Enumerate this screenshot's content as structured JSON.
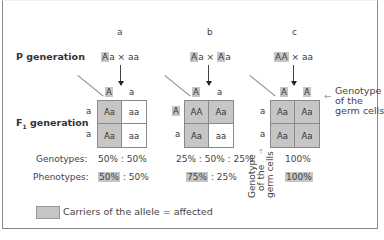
{
  "rows": {
    "p_generation": "P generation",
    "f1_generation_prefix": "F",
    "f1_generation_sub": "1",
    "f1_generation_suffix": " generation",
    "genotypes": "Genotypes:",
    "phenotypes": "Phenotypes:"
  },
  "cases": [
    {
      "label": "a",
      "cross": {
        "parent1_hl": "A",
        "parent1_rest": "a",
        "times": "×",
        "parent2_hl": "",
        "parent2_rest": "aa"
      },
      "gametes_top": [
        {
          "text": "A",
          "hl": true
        },
        {
          "text": "a",
          "hl": false
        }
      ],
      "gametes_left": [
        {
          "text": "a",
          "hl": false
        },
        {
          "text": "a",
          "hl": false
        }
      ],
      "cells": [
        {
          "text": "Aa",
          "affected": true
        },
        {
          "text": "aa",
          "affected": false
        },
        {
          "text": "Aa",
          "affected": true
        },
        {
          "text": "aa",
          "affected": false
        }
      ],
      "genotypes": "50% : 50%",
      "phenotypes_hl": "50%",
      "phenotypes_rest": " : 50%"
    },
    {
      "label": "b",
      "cross": {
        "parent1_hl": "A",
        "parent1_rest": "a",
        "times": "×",
        "parent2_hl": "A",
        "parent2_rest": "a"
      },
      "gametes_top": [
        {
          "text": "A",
          "hl": true
        },
        {
          "text": "a",
          "hl": false
        }
      ],
      "gametes_left": [
        {
          "text": "A",
          "hl": true
        },
        {
          "text": "a",
          "hl": false
        }
      ],
      "cells": [
        {
          "text": "AA",
          "affected": true
        },
        {
          "text": "Aa",
          "affected": true
        },
        {
          "text": "Aa",
          "affected": true
        },
        {
          "text": "aa",
          "affected": false
        }
      ],
      "genotypes": "25% : 50% : 25%",
      "phenotypes_hl": "75%",
      "phenotypes_rest": " : 25%"
    },
    {
      "label": "c",
      "cross": {
        "parent1_hl": "AA",
        "parent1_rest": "",
        "times": "×",
        "parent2_hl": "",
        "parent2_rest": "aa"
      },
      "gametes_top": [
        {
          "text": "A",
          "hl": true
        },
        {
          "text": "A",
          "hl": true
        }
      ],
      "gametes_left": [
        {
          "text": "a",
          "hl": false
        },
        {
          "text": "a",
          "hl": false
        }
      ],
      "cells": [
        {
          "text": "Aa",
          "affected": true
        },
        {
          "text": "Aa",
          "affected": true
        },
        {
          "text": "Aa",
          "affected": true
        },
        {
          "text": "Aa",
          "affected": true
        }
      ],
      "genotypes": "100%",
      "phenotypes_hl": "100%",
      "phenotypes_rest": ""
    }
  ],
  "annotations": {
    "germ_cells_right": [
      "Genotype",
      "of the",
      "germ cells"
    ],
    "germ_cells_vertical": [
      "Genotype",
      "of the",
      "germ cells"
    ]
  },
  "legend": {
    "label": "Carriers of the allele = affected",
    "swatch_color": "#c6c6c6"
  },
  "colors": {
    "affected": "#c6c6c6",
    "unaffected": "#ffffff",
    "border": "#8a8a8a"
  }
}
